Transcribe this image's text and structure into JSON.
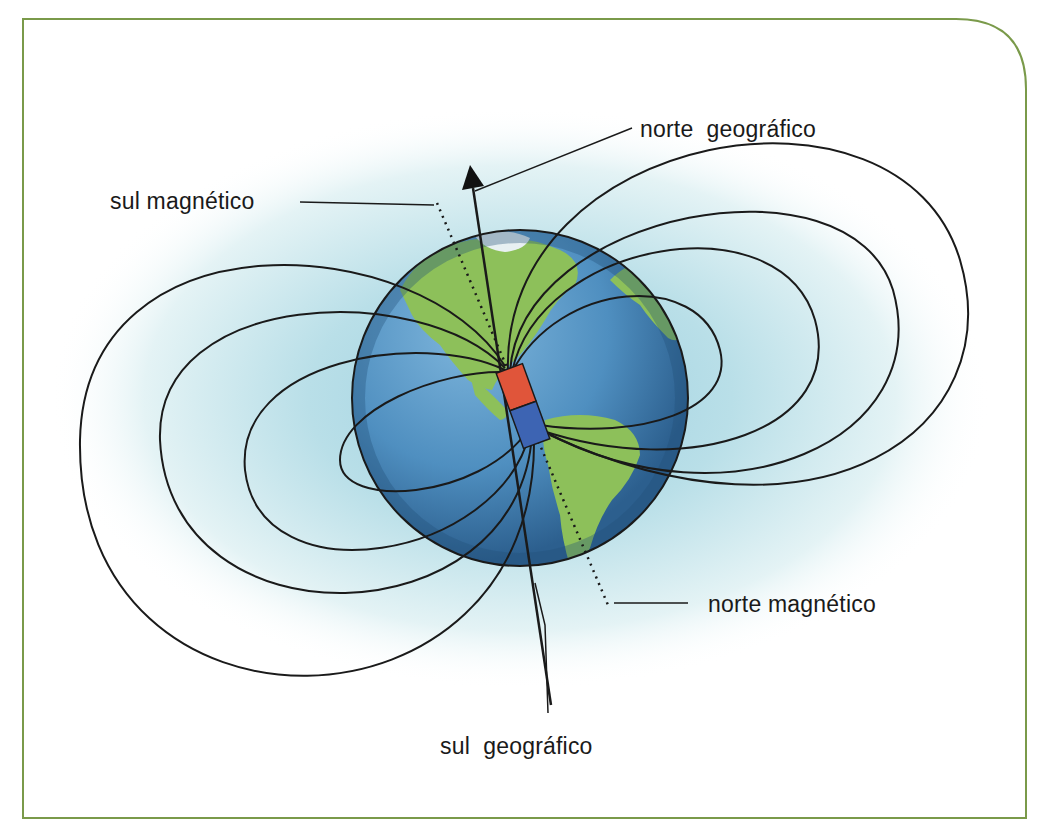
{
  "figure": {
    "type": "earth-magnetic-field-diagram",
    "frame_color": "#7a9a4a",
    "colors": {
      "field_line": "#1a1a1a",
      "ocean": "#4f8fc0",
      "land": "#8dc05a",
      "halo": "#bfe3ea",
      "magnet_north_half": "#e0553a",
      "magnet_south_half": "#3d64b3"
    }
  },
  "labels": {
    "geographic_north": "norte  geográfico",
    "magnetic_south": "sul magnético",
    "magnetic_north": "norte magnético",
    "geographic_south": "sul  geográfico"
  }
}
